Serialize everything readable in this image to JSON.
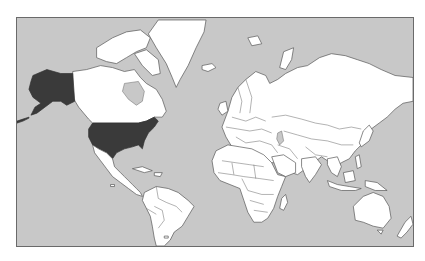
{
  "map": {
    "type": "world-political-outline",
    "projection": "mercator",
    "highlighted_regions": [
      "United States",
      "Alaska"
    ],
    "colors": {
      "ocean": "#c8c8c8",
      "land": "#ffffff",
      "highlight": "#3a3a3a",
      "border": "#666666"
    }
  }
}
